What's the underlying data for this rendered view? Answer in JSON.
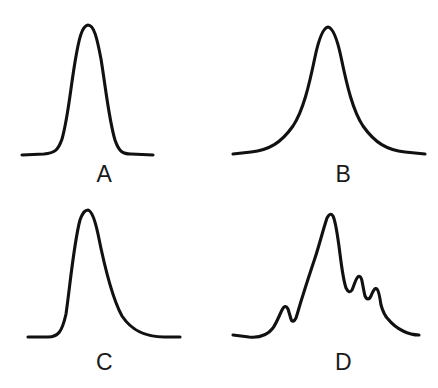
{
  "figure": {
    "background_color": "#ffffff",
    "line_color": "#111111",
    "width": 438,
    "height": 388,
    "panel_count": 4
  },
  "panels": [
    {
      "id": "A",
      "label": "A",
      "shape_name": "symmetric-gaussian-peak",
      "description": "Symmetric Gaussian peak, flat baseline on both sides",
      "apex": {
        "x": 85,
        "y": 25
      },
      "baseline_y": 155,
      "left_baseline_start_x": 22,
      "right_baseline_end_x": 135,
      "asymmetry_factor": 1.0,
      "path": "M 22 155 L 44 154 C 54 153 58 151 62 139 C 68 118 70 92 75 62 C 79 38 82 26 88 25 C 94 25 97 38 101 59 C 106 90 109 120 115 140 C 119 152 123 154 131 154 L 153 155"
    },
    {
      "id": "B",
      "label": "B",
      "shape_name": "lorentzian-peak",
      "description": "Lorentzian peak, narrow apex with long broad tails",
      "apex": {
        "x": 109,
        "y": 27
      },
      "baseline_y": 155,
      "left_baseline_start_x": 14,
      "right_baseline_end_x": 206,
      "asymmetry_factor": 1.0,
      "path": "M 14 154 L 32 152 C 50 150 62 143 74 126 C 84 111 90 86 96 57 C 100 38 104 28 109 27 C 114 28 118 38 122 57 C 128 86 134 111 144 126 C 156 143 168 150 186 152 L 206 154"
    },
    {
      "id": "C",
      "label": "C",
      "shape_name": "tailing-peak",
      "description": "Asymmetric peak with tailing: steep leading edge, long trailing tail",
      "apex": {
        "x": 85,
        "y": 16
      },
      "baseline_y": 144,
      "left_baseline_start_x": 28,
      "right_baseline_end_x": 180,
      "asymmetry_factor": 2.4,
      "path": "M 28 143 L 48 143 C 58 143 62 138 66 120 C 70 92 74 48 80 26 C 83 18 85 16 88 16 C 92 17 95 26 98 40 C 104 70 112 104 122 122 C 134 140 150 143 164 143 L 180 143"
    },
    {
      "id": "D",
      "label": "D",
      "shape_name": "multi-modal-peak-with-shoulders",
      "description": "Unresolved multi-component envelope: main peak with left shoulder bumps and a right-side descending staircase of partially resolved peaks",
      "apex": {
        "x": 111,
        "y": 19
      },
      "baseline_y": 144,
      "left_baseline_start_x": 14,
      "right_baseline_end_x": 200,
      "shoulder_count": 4,
      "path": "M 14 141 L 30 143 C 40 144 48 142 54 134 C 58 128 60 122 63 116 C 65 112 67 111 69 115 C 70 118 71 122 72 125 C 73 128 75 128 77 124 C 79 118 81 110 84 101 C 88 88 92 76 96 64 C 100 52 104 36 108 24 C 110 20 112 19 114 22 C 117 28 119 44 121 60 C 123 76 125 88 127 94 C 129 98 131 99 133 96 C 135 92 136 87 138 84 C 140 81 142 82 143 87 C 144 92 145 98 146 102 C 148 106 150 106 152 102 C 154 97 156 93 158 95 C 160 97 161 104 162 111 C 164 118 166 122 169 125 C 173 130 178 134 184 137 C 190 140 196 141 200 141"
    }
  ]
}
